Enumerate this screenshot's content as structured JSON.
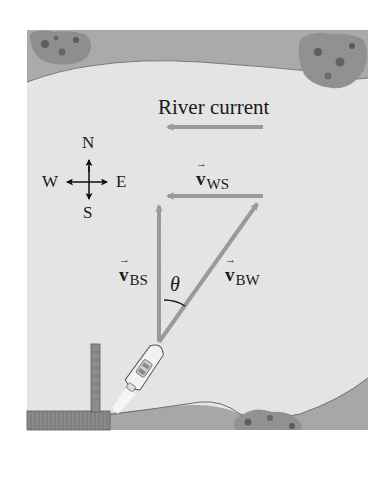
{
  "figure": {
    "river_label": "River current",
    "compass": {
      "north": "N",
      "south": "S",
      "east": "E",
      "west": "W"
    },
    "vectors": [
      {
        "id": "v_ws",
        "symbol": "v",
        "subscript": "WS",
        "meaning": "water relative to shore"
      },
      {
        "id": "v_bs",
        "symbol": "v",
        "subscript": "BS",
        "meaning": "boat relative to shore"
      },
      {
        "id": "v_bw",
        "symbol": "v",
        "subscript": "BW",
        "meaning": "boat relative to water"
      }
    ],
    "angle_label": "θ",
    "colors": {
      "water": "#e4e4e4",
      "bank": "#a8a8a8",
      "vector": "#9a9a9a",
      "text": "#1a1a1a"
    }
  }
}
